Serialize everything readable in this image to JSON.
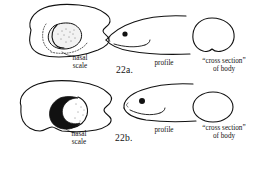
{
  "figure": {
    "type": "taxonomic-key-illustration",
    "couplet": "22",
    "background_color": "#ffffff",
    "ink_color": "#111111"
  },
  "couplets": [
    {
      "id": "22a",
      "number_label": "22a.",
      "nasal_scale": {
        "label_line1": "nasal",
        "label_line2": "scale",
        "appearance": "outlined crescent scale, stippled interior, surrounded by dashed ring of small scales"
      },
      "profile": {
        "label": "profile",
        "appearance": "slender pointed snout, sharply tapering head"
      },
      "cross_section": {
        "label_line1": "“cross section”",
        "label_line2": "of body",
        "appearance": "rounded dome with flattened notched ventral surface"
      }
    },
    {
      "id": "22b",
      "number_label": "22b.",
      "nasal_scale": {
        "label_line1": "nasal",
        "label_line2": "scale",
        "appearance": "solid black crescent scale with small stippled highlight"
      },
      "profile": {
        "label": "profile",
        "appearance": "blunt rounded snout, deeper head"
      },
      "cross_section": {
        "label_line1": "“cross section”",
        "label_line2": "of body",
        "appearance": "plain broad ellipse"
      }
    }
  ]
}
